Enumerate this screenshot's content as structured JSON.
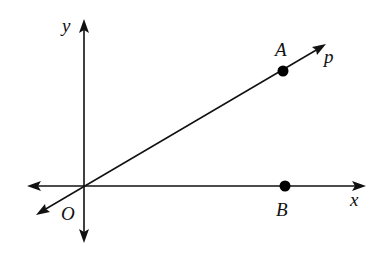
{
  "diagram": {
    "type": "coordinate-plane",
    "labels": {
      "y_axis": "y",
      "x_axis": "x",
      "origin": "O",
      "point_a": "A",
      "point_b": "B",
      "line": "p"
    },
    "origin_px": [
      84,
      186
    ],
    "points": [
      {
        "name": "A",
        "px": [
          283,
          71
        ],
        "on": "line p"
      },
      {
        "name": "B",
        "px": [
          285,
          186
        ],
        "on": "x-axis"
      }
    ],
    "lines": [
      {
        "name": "p",
        "through": [
          "O",
          "A"
        ],
        "bidirectional": true
      },
      {
        "name": "x-axis",
        "bidirectional": true
      },
      {
        "name": "y-axis",
        "bidirectional": true
      }
    ],
    "colors": {
      "ink": "#111111",
      "background": "#ffffff"
    }
  }
}
